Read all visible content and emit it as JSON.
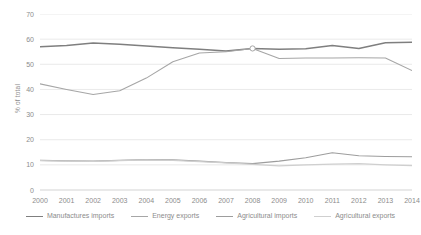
{
  "chart_data": {
    "type": "line",
    "title": "",
    "xlabel": "",
    "ylabel": "% of total",
    "ylim": [
      0,
      70
    ],
    "yticks": [
      0,
      10,
      20,
      30,
      40,
      50,
      60,
      70
    ],
    "grid": true,
    "legend_position": "bottom",
    "categories": [
      "2000",
      "2001",
      "2002",
      "2003",
      "2004",
      "2005",
      "2006",
      "2007",
      "2008",
      "2009",
      "2010",
      "2011",
      "2012",
      "2013",
      "2014"
    ],
    "series": [
      {
        "name": "Manufactures imports",
        "color": "#7f7f7f",
        "values": [
          57.0,
          57.5,
          58.5,
          58.0,
          57.3,
          56.6,
          56.0,
          55.3,
          56.3,
          56.0,
          56.2,
          57.5,
          56.3,
          58.6,
          58.8
        ]
      },
      {
        "name": "Energy exports",
        "color": "#a6a6a6",
        "values": [
          42.2,
          40.0,
          38.0,
          39.5,
          44.5,
          51.0,
          54.5,
          55.0,
          56.3,
          52.3,
          52.5,
          52.5,
          52.6,
          52.5,
          47.5
        ]
      },
      {
        "name": "Agricultural imports",
        "color": "#9d9d9d",
        "values": [
          11.8,
          11.6,
          11.5,
          11.8,
          12.1,
          12.0,
          11.5,
          10.9,
          10.5,
          11.5,
          12.8,
          14.8,
          13.6,
          13.3,
          13.2
        ]
      },
      {
        "name": "Agricultural exports",
        "color": "#cfcfcf",
        "values": [
          11.7,
          11.5,
          11.4,
          11.7,
          12.0,
          11.8,
          11.3,
          10.8,
          10.2,
          9.6,
          10.0,
          10.3,
          10.5,
          10.0,
          9.7
        ]
      }
    ],
    "marker": {
      "x_category": "2008",
      "series": "Energy exports",
      "shape": "circle"
    }
  }
}
